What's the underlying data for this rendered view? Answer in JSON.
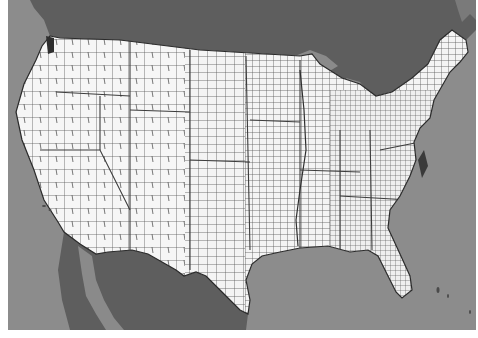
{
  "map": {
    "subject": "Contiguous United States county boundaries",
    "colors": {
      "ocean": "#8c8c8c",
      "neighbor_land": "#5e5e5e",
      "lakes": "#8a8a8a",
      "us_land": "#f4f4f4",
      "county_lines": "#4a4a4a",
      "frame_background": "#ffffff"
    },
    "regions": [
      {
        "name": "Pacific Ocean"
      },
      {
        "name": "Canada"
      },
      {
        "name": "Mexico"
      },
      {
        "name": "Gulf of Mexico"
      },
      {
        "name": "Atlantic Ocean"
      },
      {
        "name": "Great Lakes"
      },
      {
        "name": "Baja California"
      }
    ]
  }
}
